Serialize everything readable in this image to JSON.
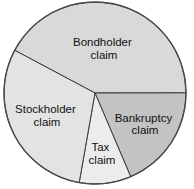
{
  "chart_data": {
    "type": "pie",
    "title": "",
    "start_angle_deg_clockwise_from_top": 298,
    "slices": [
      {
        "label_lines": [
          "Bondholder",
          "claim"
        ],
        "value": 42.2,
        "color": "#d9d9d9"
      },
      {
        "label_lines": [
          "Bankruptcy",
          "claim"
        ],
        "value": 18.6,
        "color": "#c3c3c3"
      },
      {
        "label_lines": [
          "Tax",
          "claim"
        ],
        "value": 9.2,
        "color": "#ececec"
      },
      {
        "label_lines": [
          "Stockholder",
          "claim"
        ],
        "value": 30.0,
        "color": "#e3e3e3"
      }
    ],
    "legend": "none",
    "units": "percent (estimated from slice angles)"
  }
}
